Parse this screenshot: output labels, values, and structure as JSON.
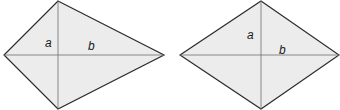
{
  "figures": [
    {
      "name": "kite",
      "vertices": {
        "top": [
          58,
          1
        ],
        "right": [
          164,
          55
        ],
        "bottom": [
          58,
          109
        ],
        "left": [
          4,
          55
        ]
      },
      "labels": [
        {
          "text": "a",
          "x": 45,
          "y": 47
        },
        {
          "text": "b",
          "x": 88,
          "y": 50
        }
      ]
    },
    {
      "name": "rhombus",
      "vertices": {
        "top": [
          261,
          1
        ],
        "right": [
          339,
          55
        ],
        "bottom": [
          261,
          109
        ],
        "left": [
          180,
          55
        ]
      },
      "labels": [
        {
          "text": "a",
          "x": 247,
          "y": 39
        },
        {
          "text": "b",
          "x": 279,
          "y": 54
        }
      ]
    }
  ],
  "colors": {
    "fill": "#ececec",
    "stroke": "#2b2b2b",
    "diagonal": "#6e6e6e"
  }
}
